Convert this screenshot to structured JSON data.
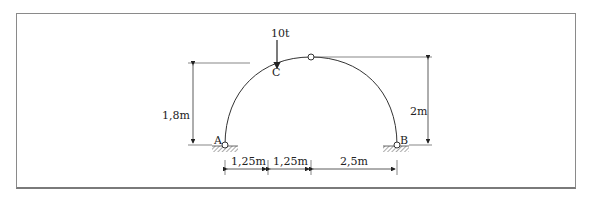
{
  "diagram": {
    "type": "three-hinged arch structural diagram",
    "load": {
      "label": "10t",
      "point": "C"
    },
    "points": {
      "A": "A",
      "B": "B",
      "C": "C"
    },
    "dimensions": {
      "height_C": "1,8m",
      "height_crown": "2m",
      "spans": [
        "1,25m",
        "1,25m",
        "2,5m"
      ]
    }
  }
}
